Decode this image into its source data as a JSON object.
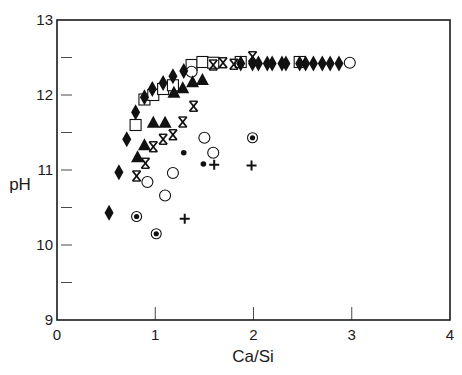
{
  "chart_data": {
    "type": "scatter",
    "title": "",
    "xlabel": "Ca/Si",
    "ylabel": "pH",
    "xlim": [
      0,
      4
    ],
    "ylim": [
      9,
      13
    ],
    "x_ticks": [
      0,
      1,
      2,
      3,
      4
    ],
    "y_ticks": [
      9,
      10,
      11,
      12,
      13
    ],
    "y_minor_ticks": [
      9.5,
      10.5,
      11.5,
      12.5
    ],
    "grid": false,
    "legend": null,
    "colors": {
      "axis": "#1a1a1a",
      "marker": "#111111",
      "background": "#ffffff"
    },
    "series": [
      {
        "name": "filled-diamond",
        "marker": "diamond-filled",
        "points": [
          [
            0.53,
            10.43
          ],
          [
            0.63,
            10.97
          ],
          [
            0.71,
            11.41
          ],
          [
            0.8,
            11.77
          ],
          [
            0.89,
            11.97
          ],
          [
            0.97,
            12.08
          ],
          [
            1.08,
            12.16
          ],
          [
            1.18,
            12.25
          ],
          [
            1.29,
            12.32
          ],
          [
            1.87,
            12.42
          ],
          [
            1.99,
            12.42
          ],
          [
            2.05,
            12.42
          ],
          [
            2.14,
            12.42
          ],
          [
            2.19,
            12.42
          ],
          [
            2.29,
            12.42
          ],
          [
            2.33,
            12.42
          ],
          [
            2.47,
            12.42
          ],
          [
            2.53,
            12.42
          ],
          [
            2.61,
            12.42
          ],
          [
            2.7,
            12.42
          ],
          [
            2.78,
            12.42
          ],
          [
            2.87,
            12.42
          ]
        ]
      },
      {
        "name": "open-square",
        "marker": "square-open",
        "points": [
          [
            0.8,
            11.6
          ],
          [
            0.89,
            11.94
          ],
          [
            0.98,
            12.0
          ],
          [
            1.08,
            12.08
          ],
          [
            1.18,
            12.13
          ],
          [
            1.37,
            12.4
          ],
          [
            1.48,
            12.44
          ],
          [
            1.59,
            12.43
          ],
          [
            1.87,
            12.44
          ],
          [
            2.47,
            12.44
          ]
        ]
      },
      {
        "name": "filled-triangle",
        "marker": "triangle-filled",
        "points": [
          [
            0.82,
            11.17
          ],
          [
            0.89,
            11.33
          ],
          [
            0.98,
            11.63
          ],
          [
            1.1,
            11.63
          ],
          [
            1.19,
            12.03
          ],
          [
            1.28,
            12.09
          ],
          [
            1.38,
            12.17
          ],
          [
            1.48,
            12.2
          ]
        ]
      },
      {
        "name": "asterisk",
        "marker": "asterisk",
        "points": [
          [
            0.81,
            10.92
          ],
          [
            0.9,
            11.09
          ],
          [
            0.98,
            11.31
          ],
          [
            1.08,
            11.41
          ],
          [
            1.18,
            11.47
          ],
          [
            1.28,
            11.64
          ],
          [
            1.39,
            11.85
          ],
          [
            1.59,
            12.4
          ],
          [
            1.69,
            12.43
          ],
          [
            1.8,
            12.41
          ],
          [
            1.99,
            12.51
          ]
        ]
      },
      {
        "name": "open-circle",
        "marker": "circle-open",
        "points": [
          [
            0.92,
            10.84
          ],
          [
            1.1,
            10.66
          ],
          [
            1.18,
            10.96
          ],
          [
            1.5,
            11.43
          ],
          [
            1.59,
            11.23
          ],
          [
            1.37,
            12.31
          ],
          [
            2.98,
            12.43
          ]
        ]
      },
      {
        "name": "circled-dot",
        "marker": "bullseye",
        "points": [
          [
            0.81,
            10.38
          ],
          [
            1.01,
            10.15
          ],
          [
            1.99,
            11.43
          ]
        ]
      },
      {
        "name": "small-dot",
        "marker": "dot",
        "points": [
          [
            1.29,
            11.23
          ],
          [
            1.49,
            11.08
          ]
        ]
      },
      {
        "name": "plus",
        "marker": "plus",
        "points": [
          [
            1.3,
            10.35
          ],
          [
            1.6,
            11.07
          ],
          [
            1.98,
            11.06
          ]
        ]
      }
    ]
  }
}
